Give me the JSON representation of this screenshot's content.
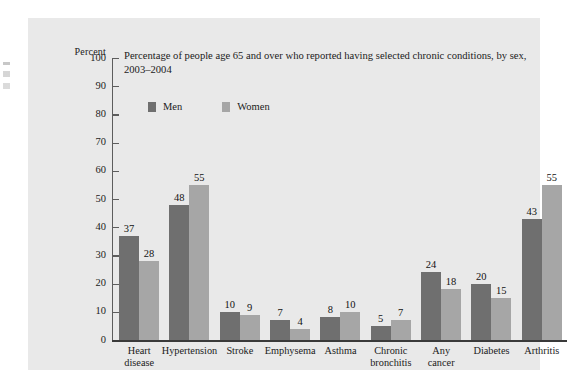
{
  "chart_data": {
    "type": "bar",
    "title": "Percentage of people age 65 and over who reported having selected chronic conditions, by sex, 2003–2004",
    "xlabel": "",
    "ylabel": "Percent",
    "ylim": [
      0,
      100
    ],
    "ytick_step": 10,
    "yticks": [
      "100",
      "90",
      "80",
      "70",
      "60",
      "50",
      "40",
      "30",
      "20",
      "10",
      "0"
    ],
    "grid": false,
    "legend_position": "top-left-inside",
    "categories": [
      "Heart disease",
      "Hypertension",
      "Stroke",
      "Emphysema",
      "Asthma",
      "Chronic bronchitis",
      "Any cancer",
      "Diabetes",
      "Arthritis"
    ],
    "category_lines": [
      [
        "Heart",
        "disease"
      ],
      [
        "Hypertension"
      ],
      [
        "Stroke"
      ],
      [
        "Emphysema"
      ],
      [
        "Asthma"
      ],
      [
        "Chronic",
        "bronchitis"
      ],
      [
        "Any",
        "cancer"
      ],
      [
        "Diabetes"
      ],
      [
        "Arthritis"
      ]
    ],
    "series": [
      {
        "name": "Men",
        "color": "#6f6f6f",
        "values": [
          37,
          48,
          10,
          7,
          8,
          5,
          24,
          20,
          43
        ]
      },
      {
        "name": "Women",
        "color": "#a6a6a6",
        "values": [
          28,
          55,
          9,
          4,
          10,
          7,
          18,
          15,
          55
        ]
      }
    ]
  },
  "colors": {
    "panel_background": "#e9e9e9",
    "men_bar": "#6f6f6f",
    "women_bar": "#a6a6a6",
    "axis": "#5d5d5d",
    "baseline": "#3a3a3a",
    "text": "#1b1b1b"
  }
}
